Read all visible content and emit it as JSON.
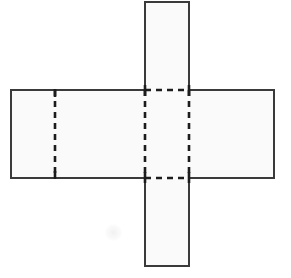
{
  "figure": {
    "kind": "geometry-net",
    "canvas": {
      "width": 291,
      "height": 278
    },
    "colors": {
      "background": "#ffffff",
      "face_fill": "#fafafa",
      "solid_edge": "#3a3a3a",
      "fold_line": "#1c1c1c"
    },
    "strokes": {
      "solid_edge_width": 2,
      "fold_line_width": 2.6,
      "fold_dash_pattern": "6 5"
    },
    "geometry": {
      "horizontal_band": {
        "x1": 11,
        "y1": 90,
        "x2": 274,
        "y2": 178
      },
      "vertical_strip": {
        "x1": 145,
        "y1": 2,
        "x2": 189,
        "y2": 266
      },
      "center_square": {
        "x1": 145,
        "y1": 90,
        "x2": 189,
        "y2": 178
      }
    },
    "solid_outline_path": "M 145 2 L 189 2 L 189 90 L 274 90 L 274 178 L 189 178 L 189 266 L 145 266 L 145 178 L 11 178 L 11 90 L 145 90 Z",
    "fold_lines": [
      {
        "name": "fold-left-inner-vertical",
        "x1": 55,
        "y1": 90,
        "x2": 55,
        "y2": 178,
        "orientation": "vertical"
      },
      {
        "name": "fold-center-left-vertical",
        "x1": 145,
        "y1": 90,
        "x2": 145,
        "y2": 178,
        "orientation": "vertical"
      },
      {
        "name": "fold-center-right-vertical",
        "x1": 189,
        "y1": 90,
        "x2": 189,
        "y2": 178,
        "orientation": "vertical"
      },
      {
        "name": "fold-center-top-horizontal",
        "x1": 145,
        "y1": 90,
        "x2": 189,
        "y2": 90,
        "orientation": "horizontal"
      },
      {
        "name": "fold-center-bottom-horizontal",
        "x1": 145,
        "y1": 178,
        "x2": 189,
        "y2": 178,
        "orientation": "horizontal"
      }
    ],
    "faces": [
      {
        "name": "face-top-flap",
        "x": 145,
        "y": 2,
        "width": 44,
        "height": 88,
        "label": ""
      },
      {
        "name": "face-left-end",
        "x": 11,
        "y": 90,
        "width": 44,
        "height": 88,
        "label": ""
      },
      {
        "name": "face-left-middle",
        "x": 55,
        "y": 90,
        "width": 90,
        "height": 88,
        "label": ""
      },
      {
        "name": "face-center",
        "x": 145,
        "y": 90,
        "width": 44,
        "height": 88,
        "label": ""
      },
      {
        "name": "face-right",
        "x": 189,
        "y": 90,
        "width": 85,
        "height": 88,
        "label": ""
      },
      {
        "name": "face-bottom-flap",
        "x": 145,
        "y": 178,
        "width": 44,
        "height": 88,
        "label": ""
      }
    ],
    "annotations": [],
    "labels": []
  }
}
